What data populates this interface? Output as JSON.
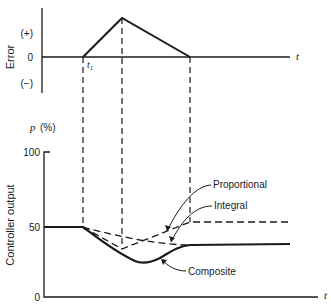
{
  "top_chart": {
    "ylabel": "Error",
    "ticks": [
      "(+)",
      "0",
      "(−)"
    ],
    "xlabel": "t",
    "t1_label": "t",
    "t1_sub": "1"
  },
  "bottom_chart": {
    "unit_label_var": "p",
    "unit_label_pct": "(%)",
    "ylabel": "Controller output",
    "ticks": [
      "100",
      "50",
      "0"
    ],
    "xlabel": "t",
    "curve_labels": {
      "proportional": "Proportional",
      "integral": "Integral",
      "composite": "Composite"
    }
  },
  "colors": {
    "ink": "#1a1a1a",
    "background": "#ffffff"
  }
}
